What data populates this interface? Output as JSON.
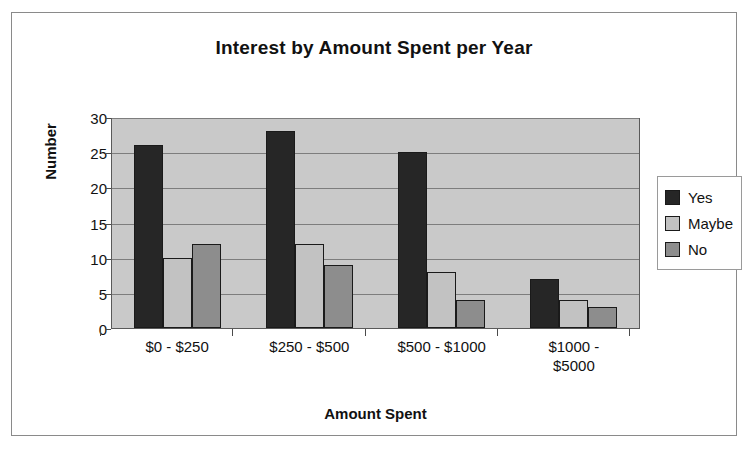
{
  "frame": {
    "border_color": "#8a8a8a"
  },
  "chart_data": {
    "type": "bar",
    "title": "Interest by Amount Spent per Year",
    "xlabel": "Amount Spent",
    "ylabel": "Number",
    "categories": [
      "$0 - $250",
      "$250 - $500",
      "$500 - $1000",
      "$1000 - $5000"
    ],
    "series": [
      {
        "name": "Yes",
        "color": "#262626",
        "values": [
          26,
          28,
          25,
          7
        ]
      },
      {
        "name": "Maybe",
        "color": "#c2c2c2",
        "values": [
          10,
          12,
          8,
          4
        ]
      },
      {
        "name": "No",
        "color": "#8d8d8d",
        "values": [
          12,
          9,
          4,
          3
        ]
      }
    ],
    "ylim": [
      0,
      30
    ],
    "yticks": [
      0,
      5,
      10,
      15,
      20,
      25,
      30
    ],
    "ytick_labels": [
      "0",
      "5",
      "10",
      "15",
      "20",
      "25",
      "30"
    ],
    "grid": true,
    "legend_position": "right",
    "plot_background": "#c9c9c9"
  }
}
